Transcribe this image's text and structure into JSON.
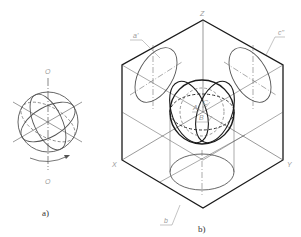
{
  "figure": {
    "part_a": {
      "caption": "a)",
      "axis_top_label": "O",
      "axis_bottom_label": "O"
    },
    "part_b": {
      "caption": "b)",
      "axis_labels": {
        "z": "Z",
        "x": "X",
        "y": "Y"
      },
      "projection_labels": {
        "left": "a'",
        "right": "c''",
        "bottom": "b"
      },
      "sphere_labels": {
        "a": "A",
        "c": "C",
        "b": "B"
      }
    }
  },
  "colors": {
    "thick_line": "#1a1a1a",
    "thin_line": "#555555",
    "label": "#9a9a9a"
  }
}
